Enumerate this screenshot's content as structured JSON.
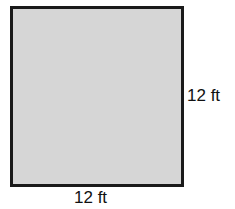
{
  "diagram": {
    "shape": "square",
    "fill_color": "#d6d6d6",
    "border_color": "#1a1a1a",
    "labels": {
      "right_side": "12 ft",
      "bottom_side": "12 ft"
    }
  }
}
